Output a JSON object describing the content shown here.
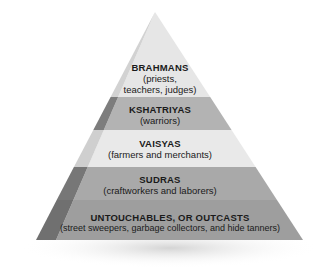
{
  "diagram": {
    "type": "pyramid",
    "levels": [
      {
        "title": "BRAHMANS",
        "subtitle_lines": [
          "(priests,",
          "teachers, judges)"
        ],
        "color": "#e6e6e6"
      },
      {
        "title": "KSHATRIYAS",
        "subtitle_lines": [
          "(warriors)"
        ],
        "color": "#b3b3b3"
      },
      {
        "title": "VAISYAS",
        "subtitle_lines": [
          "(farmers and merchants)"
        ],
        "color": "#e9e9e9"
      },
      {
        "title": "SUDRAS",
        "subtitle_lines": [
          "(craftworkers and laborers)"
        ],
        "color": "#a9a9a9"
      },
      {
        "title": "UNTOUCHABLES, OR OUTCASTS",
        "subtitle_lines": [
          "(street sweepers, garbage collectors, and hide tanners)"
        ],
        "color": "#9e9e9e"
      }
    ],
    "side_colors": [
      "#c8c8c8",
      "#7d7d7d",
      "#cfcfcf",
      "#777777",
      "#707070"
    ],
    "shadow_color": "#d9d9d9"
  }
}
